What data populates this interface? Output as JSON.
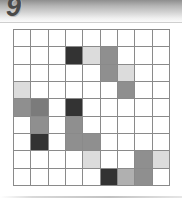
{
  "header": {
    "page_number": "9",
    "band_color_top": "#8e8e8e",
    "band_color_bottom": "#fbfbfb",
    "number_color": "#4a4a4a"
  },
  "palette": {
    "white": "#ffffff",
    "light": "#dcdcdc",
    "medium_light": "#b0b0b0",
    "medium": "#8f8f8f",
    "medium_dark": "#7b7b7b",
    "dark": "#333333",
    "grid_line": "#8a8a8a"
  },
  "puzzle": {
    "rows": 9,
    "columns": 9,
    "cell_size_px": 17.4,
    "grid": [
      [
        "white",
        "white",
        "white",
        "white",
        "white",
        "white",
        "white",
        "white",
        "white"
      ],
      [
        "white",
        "white",
        "white",
        "dark",
        "light",
        "medium",
        "white",
        "white",
        "white"
      ],
      [
        "white",
        "white",
        "white",
        "white",
        "white",
        "medium",
        "light",
        "white",
        "white"
      ],
      [
        "light",
        "white",
        "white",
        "white",
        "white",
        "white",
        "medium",
        "white",
        "white"
      ],
      [
        "medium",
        "medium_dark",
        "white",
        "dark",
        "white",
        "white",
        "white",
        "white",
        "white"
      ],
      [
        "white",
        "medium",
        "white",
        "medium",
        "white",
        "white",
        "white",
        "white",
        "white"
      ],
      [
        "white",
        "dark",
        "white",
        "medium",
        "medium",
        "white",
        "white",
        "white",
        "white"
      ],
      [
        "white",
        "white",
        "white",
        "white",
        "light",
        "white",
        "white",
        "medium",
        "light"
      ],
      [
        "white",
        "white",
        "white",
        "white",
        "white",
        "dark",
        "medium_light",
        "medium",
        "white"
      ]
    ]
  },
  "footer": {
    "rule_color": "#c2c2c2"
  }
}
